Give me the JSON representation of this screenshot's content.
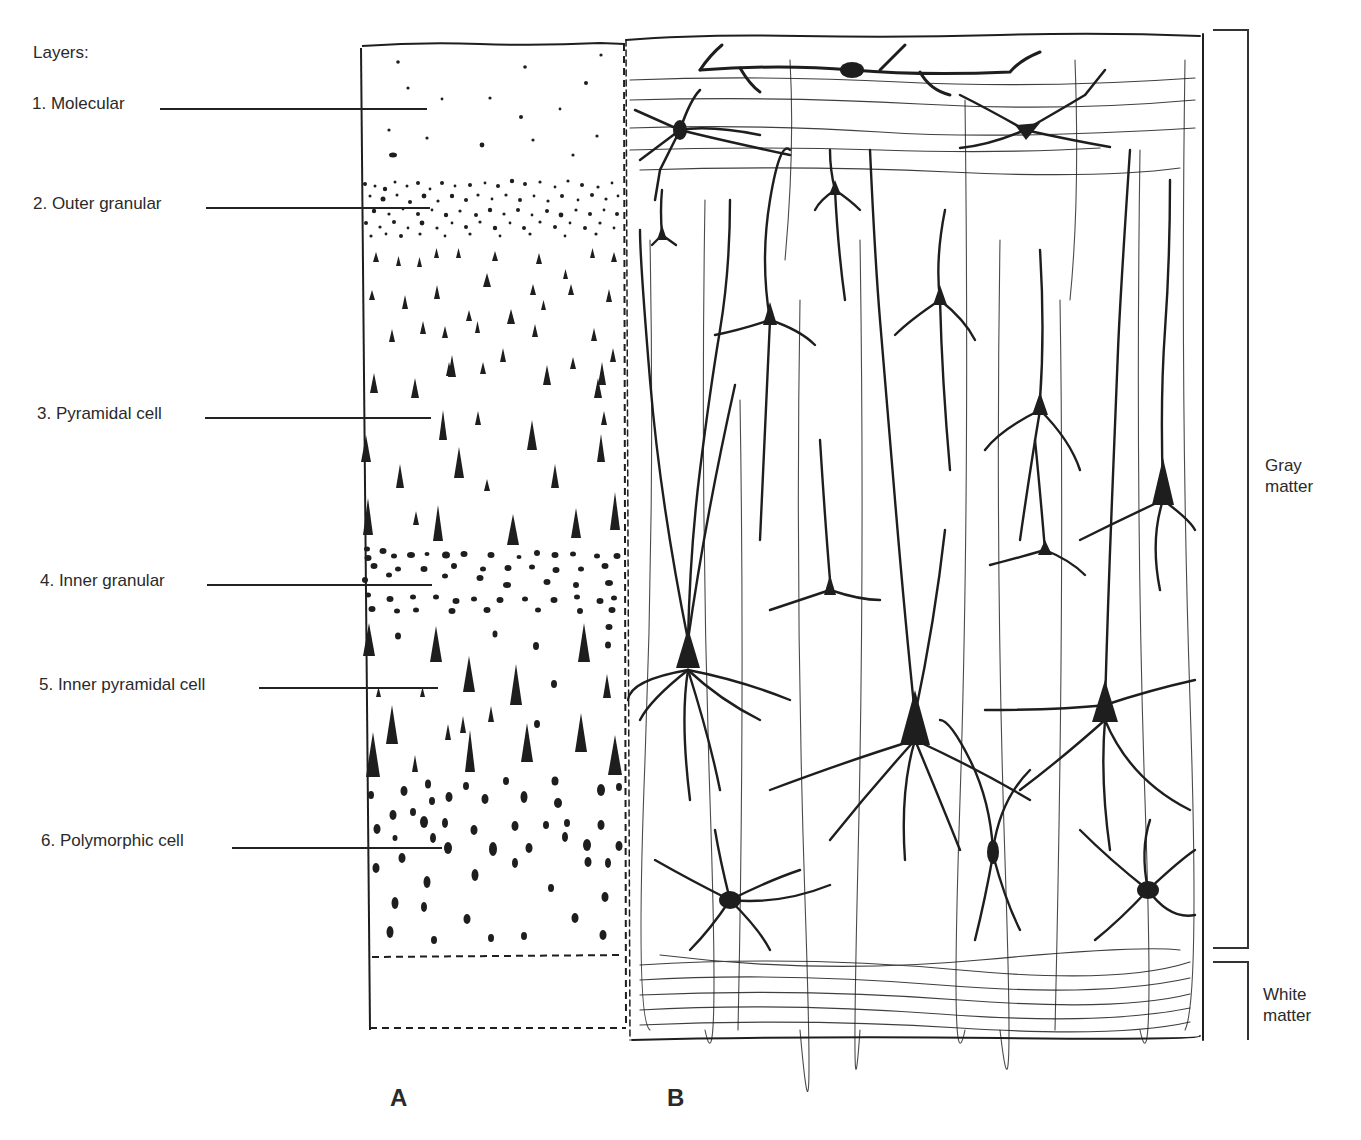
{
  "figure": {
    "layers_heading": "Layers:",
    "layers": [
      {
        "number": "1.",
        "name": "Molecular",
        "label": "1.  Molecular",
        "y": 103
      },
      {
        "number": "2.",
        "name": "Outer granular",
        "label": "2.  Outer granular",
        "y": 203
      },
      {
        "number": "3.",
        "name": "Pyramidal cell",
        "label": "3.  Pyramidal cell",
        "y": 413
      },
      {
        "number": "4.",
        "name": "Inner granular",
        "label": "4.  Inner granular",
        "y": 580
      },
      {
        "number": "5.",
        "name": "Inner pyramidal cell",
        "label": "5.  Inner pyramidal cell",
        "y": 685
      },
      {
        "number": "6.",
        "name": "Polymorphic cell",
        "label": "6.  Polymorphic cell",
        "y": 842
      }
    ],
    "regions": {
      "gray_matter": "Gray matter",
      "gray_matter_line1": "Gray",
      "gray_matter_line2": "matter",
      "white_matter": "White matter",
      "white_matter_line1": "White",
      "white_matter_line2": "matter"
    },
    "panels": {
      "a": "A",
      "b": "B"
    },
    "colors": {
      "ink": "#1e1e1e",
      "text": "#2a2a2a",
      "background": "#ffffff"
    }
  }
}
